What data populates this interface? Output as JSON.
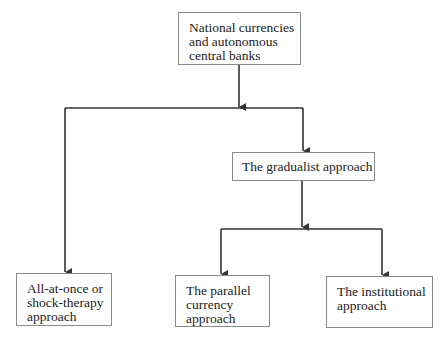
{
  "diagram": {
    "type": "hierarchy",
    "nodes": {
      "root": {
        "label": "National currencies\nand autonomous\ncentral banks"
      },
      "gradualist": {
        "label": "The gradualist approach"
      },
      "shock": {
        "label": "All-at-once or\nshock-therapy\napproach"
      },
      "parallel": {
        "label": "The parallel\ncurrency\napproach"
      },
      "institutional": {
        "label": "The institutional\napproach"
      }
    },
    "edges": [
      {
        "from": "root",
        "to": "shock"
      },
      {
        "from": "root",
        "to": "gradualist"
      },
      {
        "from": "gradualist",
        "to": "parallel"
      },
      {
        "from": "gradualist",
        "to": "institutional"
      }
    ],
    "colors": {
      "line": "#333333",
      "border": "#8a8a8a",
      "text": "#222222"
    }
  }
}
